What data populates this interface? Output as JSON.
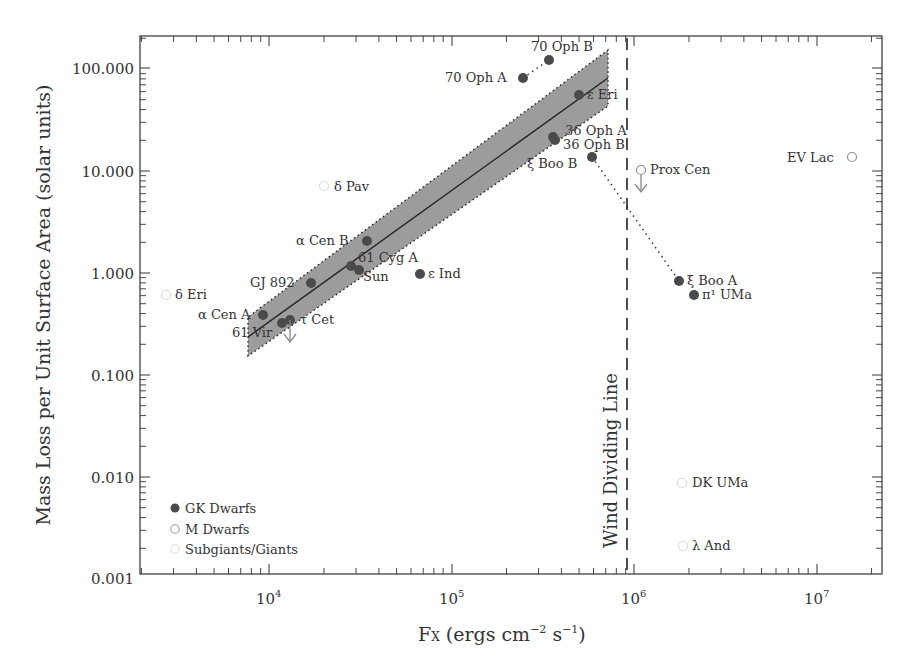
{
  "chart_data": {
    "type": "scatter",
    "title": "",
    "xlabel": "Fx (ergs cm⁻² s⁻¹)",
    "ylabel": "Mass Loss per Unit Surface Area (solar units)",
    "xscale": "log",
    "yscale": "log",
    "xlim": [
      2200,
      25000000
    ],
    "ylim": [
      0.001,
      220
    ],
    "x_ticks": [
      {
        "value": 10000,
        "label": "10⁴"
      },
      {
        "value": 100000,
        "label": "10⁵"
      },
      {
        "value": 1000000,
        "label": "10⁶"
      },
      {
        "value": 10000000,
        "label": "10⁷"
      }
    ],
    "y_ticks": [
      {
        "value": 0.001,
        "label": "0.001"
      },
      {
        "value": 0.01,
        "label": "0.010"
      },
      {
        "value": 0.1,
        "label": "0.100"
      },
      {
        "value": 1,
        "label": "1.000"
      },
      {
        "value": 10,
        "label": "10.000"
      },
      {
        "value": 100,
        "label": "100.000"
      }
    ],
    "grid": false,
    "legend": {
      "position": "lower left",
      "entries": [
        {
          "label": "GK Dwarfs",
          "marker": "filled-circle",
          "color": "#4a4a4a"
        },
        {
          "label": "M Dwarfs",
          "marker": "open-circle",
          "color": "#9a9a9a"
        },
        {
          "label": "Subgiants/Giants",
          "marker": "open-circle",
          "color": "#dcdcdc"
        }
      ]
    },
    "series": [
      {
        "name": "GK Dwarfs",
        "points": [
          {
            "label": "70 Oph B",
            "x": 340000,
            "y": 120
          },
          {
            "label": "70 Oph A",
            "x": 250000,
            "y": 80
          },
          {
            "label": "ε Eri",
            "x": 500000,
            "y": 55
          },
          {
            "label": "36 Oph A",
            "x": 360000,
            "y": 21
          },
          {
            "label": "36 Oph B",
            "x": 370000,
            "y": 20
          },
          {
            "label": "ξ Boo B",
            "x": 590000,
            "y": 13.7
          },
          {
            "label": "α Cen B",
            "x": 34500,
            "y": 2.06
          },
          {
            "label": "61 Cyg A",
            "x": 28000,
            "y": 1.17
          },
          {
            "label": "Sun",
            "x": 31000,
            "y": 1.07
          },
          {
            "label": "ε Ind",
            "x": 67000,
            "y": 0.98
          },
          {
            "label": "GJ 892",
            "x": 17000,
            "y": 0.8
          },
          {
            "label": "α Cen A",
            "x": 9300,
            "y": 0.39
          },
          {
            "label": "61 Vir",
            "x": 12000,
            "y": 0.32
          },
          {
            "label": "τ Cet",
            "x": 13000,
            "y": 0.35,
            "upper_limit": true
          },
          {
            "label": "ξ Boo A",
            "x": 1800000,
            "y": 0.84
          },
          {
            "label": "π¹ UMa",
            "x": 2100000,
            "y": 0.61
          }
        ]
      },
      {
        "name": "M Dwarfs",
        "points": [
          {
            "label": "Prox Cen",
            "x": 1100000,
            "y": 10,
            "upper_limit": true
          },
          {
            "label": "EV Lac",
            "x": 15600000,
            "y": 13.6
          }
        ]
      },
      {
        "name": "Subgiants/Giants",
        "points": [
          {
            "label": "δ Pav",
            "x": 20000,
            "y": 7.1
          },
          {
            "label": "δ Eri",
            "x": 2700,
            "y": 0.61
          },
          {
            "label": "DK UMa",
            "x": 1800000,
            "y": 0.0088
          },
          {
            "label": "λ And",
            "x": 1850000,
            "y": 0.0021
          }
        ]
      }
    ],
    "fit": {
      "x_range": [
        8000,
        800000
      ],
      "y_at_xmin": 0.23,
      "y_at_xmax": 45,
      "band_low_at_xmin": 0.15,
      "band_high_at_xmin": 0.37,
      "band_low_at_xmax": 28,
      "band_high_at_xmax": 78
    },
    "connectors": [
      {
        "from": "70 Oph A",
        "to": "70 Oph B",
        "style": "dotted"
      },
      {
        "from": "ξ Boo B",
        "to": "ξ Boo A",
        "style": "dotted"
      }
    ],
    "annotations": [
      {
        "text": "Wind Dividing Line",
        "x": 900000,
        "orientation": "vertical",
        "style": "dashed"
      }
    ]
  },
  "labels": {
    "xlabel_main": "F",
    "xlabel_sub": "X",
    "xlabel_rest1": " (ergs cm",
    "xlabel_exp1": "−2",
    "xlabel_rest2": " s",
    "xlabel_exp2": "−1",
    "xlabel_close": ")",
    "ylabel": "Mass Loss per Unit Surface Area (solar units)",
    "wind_line": "Wind Dividing Line",
    "x_ticks": [
      "4",
      "5",
      "6",
      "7"
    ],
    "x_tick_base": "10",
    "y_ticks": [
      "100.000",
      "10.000",
      "1.000",
      "0.100",
      "0.010",
      "0.001"
    ],
    "legend": [
      "GK Dwarfs",
      "M Dwarfs",
      "Subgiants/Giants"
    ],
    "points": {
      "oph70b": "70 Oph B",
      "oph70a": "70 Oph A",
      "epseri": "ε Eri",
      "oph36a": "36 Oph A",
      "oph36b": "36 Oph B",
      "xibooB": "ξ Boo B",
      "proxcen": "Prox Cen",
      "evlac": "EV Lac",
      "deltapav": "δ Pav",
      "alphacenb": "α Cen B",
      "cyg61a": "61 Cyg A",
      "sun": "Sun",
      "epsind": "ε Ind",
      "gj892": "GJ 892",
      "deltaeri": "δ Eri",
      "alphacena": "α Cen A",
      "vir61": "61 Vir",
      "taucet": "τ Cet",
      "xibooA": "ξ Boo A",
      "pi1uma": "π¹ UMa",
      "dkuma": "DK UMa",
      "lambdaand": "λ And"
    }
  },
  "colors": {
    "gk": "#4a4a4a",
    "m": "#9a9a9a",
    "giant": "#dcdcdc",
    "band": "#9c9c9c",
    "axis": "#333333"
  }
}
